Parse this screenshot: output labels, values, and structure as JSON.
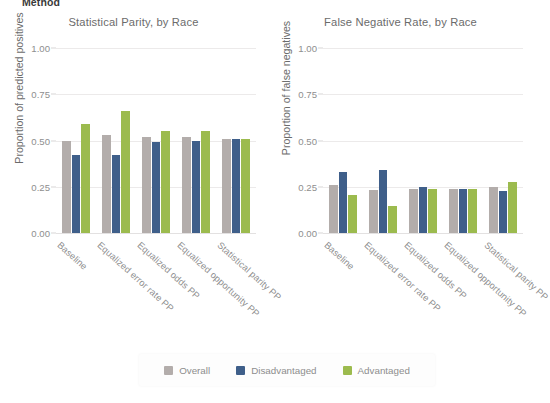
{
  "top_partial_label": "Method",
  "legend": {
    "position": "bottom-center",
    "items": [
      {
        "label": "Overall",
        "color": "#b3adab"
      },
      {
        "label": "Disadvantaged",
        "color": "#3f5f8a"
      },
      {
        "label": "Advantaged",
        "color": "#9cbb4e"
      }
    ]
  },
  "chart_data": [
    {
      "type": "bar",
      "title": "Statistical Parity, by Race",
      "xlabel": "",
      "ylabel": "Proportion of predicted positives",
      "ylim": [
        0,
        1.0
      ],
      "yticks": [
        "0.00",
        "0.25",
        "0.50",
        "0.75",
        "1.00"
      ],
      "ytick_values": [
        0.0,
        0.25,
        0.5,
        0.75,
        1.0
      ],
      "grid": true,
      "categories": [
        "Baseline",
        "Equalized error rate PP",
        "Equalized odds PP",
        "Equalized opportunity PP",
        "Statistical parity PP"
      ],
      "series": [
        {
          "name": "Overall",
          "color": "#b3adab",
          "values": [
            0.5,
            0.53,
            0.52,
            0.52,
            0.51
          ]
        },
        {
          "name": "Disadvantaged",
          "color": "#3f5f8a",
          "values": [
            0.42,
            0.42,
            0.49,
            0.5,
            0.51
          ]
        },
        {
          "name": "Advantaged",
          "color": "#9cbb4e",
          "values": [
            0.59,
            0.66,
            0.55,
            0.55,
            0.51
          ]
        }
      ]
    },
    {
      "type": "bar",
      "title": "False Negative Rate, by Race",
      "xlabel": "",
      "ylabel": "Proportion of false negatives",
      "ylim": [
        0,
        1.0
      ],
      "yticks": [
        "0.00",
        "0.25",
        "0.50",
        "0.75",
        "1.00"
      ],
      "ytick_values": [
        0.0,
        0.25,
        0.5,
        0.75,
        1.0
      ],
      "grid": true,
      "categories": [
        "Baseline",
        "Equalized error rate PP",
        "Equalized odds PP",
        "Equalized opportunity PP",
        "Statistical parity PP"
      ],
      "series": [
        {
          "name": "Overall",
          "color": "#b3adab",
          "values": [
            0.26,
            0.23,
            0.24,
            0.24,
            0.25
          ]
        },
        {
          "name": "Disadvantaged",
          "color": "#3f5f8a",
          "values": [
            0.33,
            0.34,
            0.25,
            0.24,
            0.225
          ]
        },
        {
          "name": "Advantaged",
          "color": "#9cbb4e",
          "values": [
            0.205,
            0.145,
            0.24,
            0.24,
            0.275
          ]
        }
      ]
    }
  ]
}
